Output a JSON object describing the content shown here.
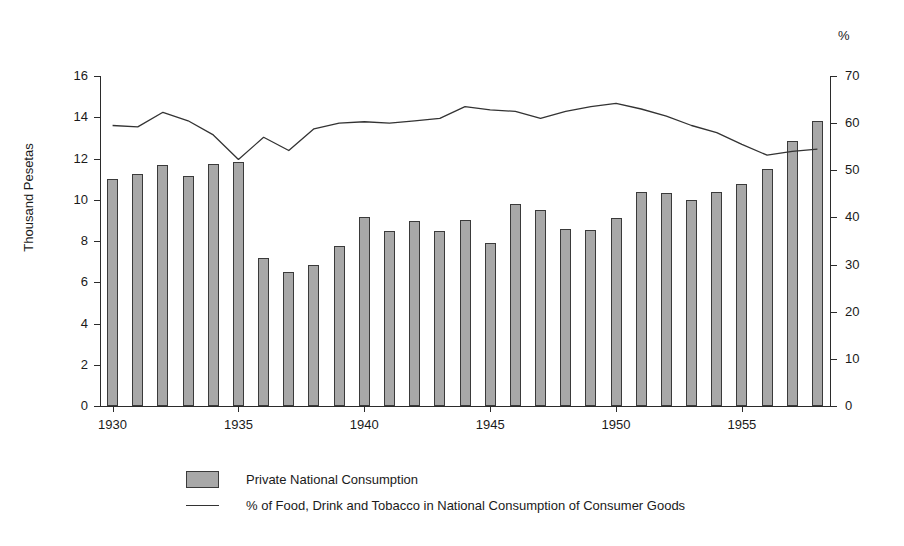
{
  "figure": {
    "right_axis_unit_label": "%",
    "left_axis_title": "Thousand Pesetas"
  },
  "legend": {
    "items": [
      {
        "label": "Private National Consumption",
        "marker": "bar-swatch",
        "color": "#a8a8a8"
      },
      {
        "label": "% of Food, Drink and Tobacco in National Consumption of Consumer Goods",
        "marker": "line-swatch",
        "color": "#333333"
      }
    ]
  },
  "chart_data": {
    "type": "bar",
    "title": "",
    "subtitle": "",
    "xlabel": "",
    "ylabel": "Thousand Pesetas",
    "y2label": "%",
    "grid": false,
    "legend_position": "bottom",
    "ylim": [
      0,
      16
    ],
    "y2lim": [
      0,
      70
    ],
    "yticks": [
      0,
      2,
      4,
      6,
      8,
      10,
      12,
      14,
      16
    ],
    "y2ticks": [
      0,
      10,
      20,
      30,
      40,
      50,
      60,
      70
    ],
    "xticks": [
      1930,
      1935,
      1940,
      1945,
      1950,
      1955
    ],
    "xlim": [
      1929.5,
      1958.5
    ],
    "x": [
      1930,
      1931,
      1932,
      1933,
      1934,
      1935,
      1936,
      1937,
      1938,
      1939,
      1940,
      1941,
      1942,
      1943,
      1944,
      1945,
      1946,
      1947,
      1948,
      1949,
      1950,
      1951,
      1952,
      1953,
      1954,
      1955,
      1956,
      1957,
      1958
    ],
    "categories": [
      "1930",
      "1931",
      "1932",
      "1933",
      "1934",
      "1935",
      "1936",
      "1937",
      "1938",
      "1939",
      "1940",
      "1941",
      "1942",
      "1943",
      "1944",
      "1945",
      "1946",
      "1947",
      "1948",
      "1949",
      "1950",
      "1951",
      "1952",
      "1953",
      "1954",
      "1955",
      "1956",
      "1957",
      "1958"
    ],
    "series": [
      {
        "name": "Private National Consumption",
        "type": "bar",
        "axis": "left",
        "unit": "Thousand Pesetas",
        "color": "#a8a8a8",
        "edge_color": "#3a3a3a",
        "values": [
          11.0,
          11.25,
          11.7,
          11.15,
          11.75,
          11.85,
          7.2,
          6.5,
          6.85,
          7.75,
          9.15,
          8.5,
          8.95,
          8.5,
          9.0,
          7.9,
          9.8,
          9.5,
          8.6,
          8.55,
          9.1,
          10.4,
          10.35,
          10.0,
          10.4,
          10.75,
          11.5,
          12.85,
          13.8
        ]
      },
      {
        "name": "% of Food, Drink and Tobacco in National Consumption of Consumer Goods",
        "type": "line",
        "axis": "right",
        "unit": "%",
        "color": "#333333",
        "values": [
          59.5,
          59.2,
          62.3,
          60.5,
          57.5,
          52.3,
          57.0,
          54.2,
          58.8,
          60.0,
          60.3,
          60.0,
          60.5,
          61.0,
          63.5,
          62.8,
          62.5,
          61.0,
          62.5,
          63.5,
          64.2,
          63.0,
          61.5,
          59.5,
          58.0,
          55.5,
          53.2,
          54.0,
          54.5
        ]
      }
    ]
  }
}
